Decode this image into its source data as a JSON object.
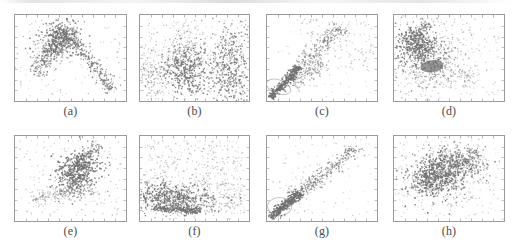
{
  "figure": {
    "width": 513,
    "height": 249,
    "background": "#ffffff",
    "rows": 2,
    "columns": 4,
    "point_color": "#6e6e6e",
    "point_color_dark": "#4a4a4a",
    "frame_color": "#9a9a9a",
    "tick_color": "#8a8a8a",
    "ellipse_color": "#b9b9b9",
    "caption_color": "#4a4a4a",
    "has_top_scan_artifact": true
  },
  "chart_data": [
    {
      "id": "a",
      "type": "scatter",
      "title": "",
      "caption": "(a)",
      "xlabel": "",
      "ylabel": "",
      "xlim": [
        0,
        1
      ],
      "ylim": [
        0,
        1
      ],
      "grid": false,
      "legend": null,
      "n_points": 1000,
      "seed": 101,
      "frame": {
        "x": 14,
        "y": 14,
        "w": 113,
        "h": 88
      },
      "caption_y": 104,
      "annotations": [],
      "clusters": [
        {
          "kind": "ridge",
          "x0": 0.18,
          "y0": 0.3,
          "x1": 0.46,
          "y1": 0.82,
          "spread": 0.045,
          "n": 230,
          "size": 1.2,
          "alpha": 0.72
        },
        {
          "kind": "ridge",
          "x0": 0.46,
          "y0": 0.82,
          "x1": 0.88,
          "y1": 0.12,
          "spread": 0.035,
          "n": 240,
          "size": 1.2,
          "alpha": 0.78
        },
        {
          "kind": "blob",
          "cx": 0.4,
          "cy": 0.72,
          "rx": 0.085,
          "ry": 0.115,
          "rot": -22,
          "n": 300,
          "size": 1.3,
          "alpha": 0.8
        },
        {
          "kind": "blob",
          "cx": 0.34,
          "cy": 0.6,
          "rx": 0.12,
          "ry": 0.08,
          "rot": 30,
          "n": 110,
          "size": 1.1,
          "alpha": 0.5
        },
        {
          "kind": "uniform",
          "x0": 0.05,
          "y0": 0.06,
          "x1": 0.95,
          "y1": 0.94,
          "n": 120,
          "size": 1.1,
          "alpha": 0.33
        }
      ]
    },
    {
      "id": "b",
      "type": "scatter",
      "title": "",
      "caption": "(b)",
      "xlabel": "",
      "ylabel": "",
      "xlim": [
        0,
        1
      ],
      "ylim": [
        0,
        1
      ],
      "grid": false,
      "legend": null,
      "n_points": 1400,
      "seed": 202,
      "frame": {
        "x": 139,
        "y": 14,
        "w": 111,
        "h": 88
      },
      "caption_y": 104,
      "annotations": [],
      "clusters": [
        {
          "kind": "blob",
          "cx": 0.44,
          "cy": 0.36,
          "rx": 0.115,
          "ry": 0.155,
          "rot": 8,
          "n": 420,
          "size": 1.25,
          "alpha": 0.78
        },
        {
          "kind": "blob",
          "cx": 0.83,
          "cy": 0.4,
          "rx": 0.095,
          "ry": 0.23,
          "rot": 0,
          "n": 400,
          "size": 1.25,
          "alpha": 0.76
        },
        {
          "kind": "blob",
          "cx": 0.1,
          "cy": 0.3,
          "rx": 0.075,
          "ry": 0.14,
          "rot": 0,
          "n": 150,
          "size": 1.1,
          "alpha": 0.5
        },
        {
          "kind": "blob",
          "cx": 0.44,
          "cy": 0.62,
          "rx": 0.07,
          "ry": 0.12,
          "rot": 0,
          "n": 110,
          "size": 1.1,
          "alpha": 0.45
        },
        {
          "kind": "uniform",
          "x0": 0.03,
          "y0": 0.05,
          "x1": 0.97,
          "y1": 0.95,
          "n": 320,
          "size": 1.1,
          "alpha": 0.34
        }
      ]
    },
    {
      "id": "c",
      "type": "scatter",
      "title": "",
      "caption": "(c)",
      "xlabel": "",
      "ylabel": "",
      "xlim": [
        0,
        1
      ],
      "ylim": [
        0,
        1
      ],
      "grid": false,
      "legend": null,
      "n_points": 900,
      "seed": 303,
      "frame": {
        "x": 266,
        "y": 14,
        "w": 112,
        "h": 88
      },
      "caption_y": 104,
      "annotations": [
        {
          "kind": "ellipse-outline",
          "cx": 0.105,
          "cy": 0.165,
          "rx": 0.115,
          "ry": 0.08,
          "rot": 20
        }
      ],
      "clusters": [
        {
          "kind": "ridge",
          "x0": 0.03,
          "y0": 0.04,
          "x1": 0.3,
          "y1": 0.4,
          "spread": 0.022,
          "n": 330,
          "size": 1.3,
          "alpha": 0.88
        },
        {
          "kind": "ridge",
          "x0": 0.28,
          "y0": 0.37,
          "x1": 0.68,
          "y1": 0.86,
          "spread": 0.045,
          "n": 200,
          "size": 1.2,
          "alpha": 0.62
        },
        {
          "kind": "ridge",
          "x0": 0.22,
          "y0": 0.18,
          "x1": 0.52,
          "y1": 0.45,
          "spread": 0.05,
          "n": 140,
          "size": 1.15,
          "alpha": 0.5
        },
        {
          "kind": "uniform",
          "x0": 0.3,
          "y0": 0.35,
          "x1": 0.97,
          "y1": 0.96,
          "n": 130,
          "size": 1.15,
          "alpha": 0.38
        },
        {
          "kind": "uniform",
          "x0": 0.05,
          "y0": 0.05,
          "x1": 0.95,
          "y1": 0.95,
          "n": 70,
          "size": 1.05,
          "alpha": 0.28
        }
      ]
    },
    {
      "id": "d",
      "type": "scatter",
      "title": "",
      "caption": "(d)",
      "xlabel": "",
      "ylabel": "",
      "xlim": [
        0,
        1
      ],
      "ylim": [
        0,
        1
      ],
      "grid": false,
      "legend": null,
      "n_points": 1300,
      "seed": 404,
      "frame": {
        "x": 393,
        "y": 14,
        "w": 112,
        "h": 88
      },
      "caption_y": 104,
      "annotations": [
        {
          "kind": "ellipse-filled",
          "cx": 0.345,
          "cy": 0.405,
          "rx": 0.105,
          "ry": 0.07,
          "rot": -8
        }
      ],
      "clusters": [
        {
          "kind": "blob",
          "cx": 0.215,
          "cy": 0.64,
          "rx": 0.09,
          "ry": 0.11,
          "rot": 15,
          "n": 380,
          "size": 1.25,
          "alpha": 0.84
        },
        {
          "kind": "blob",
          "cx": 0.34,
          "cy": 0.48,
          "rx": 0.135,
          "ry": 0.15,
          "rot": 0,
          "n": 330,
          "size": 1.2,
          "alpha": 0.64
        },
        {
          "kind": "ridge",
          "x0": 0.16,
          "y0": 0.72,
          "x1": 0.32,
          "y1": 0.9,
          "spread": 0.03,
          "n": 100,
          "size": 1.15,
          "alpha": 0.6
        },
        {
          "kind": "blob",
          "cx": 0.3,
          "cy": 0.43,
          "rx": 0.215,
          "ry": 0.25,
          "rot": 0,
          "n": 250,
          "size": 1.1,
          "alpha": 0.38
        },
        {
          "kind": "blob",
          "cx": 0.64,
          "cy": 0.3,
          "rx": 0.075,
          "ry": 0.055,
          "rot": 0,
          "n": 60,
          "size": 1.1,
          "alpha": 0.4
        },
        {
          "kind": "uniform",
          "x0": 0.04,
          "y0": 0.05,
          "x1": 0.96,
          "y1": 0.95,
          "n": 160,
          "size": 1.1,
          "alpha": 0.32
        }
      ]
    },
    {
      "id": "e",
      "type": "scatter",
      "title": "",
      "caption": "(e)",
      "xlabel": "",
      "ylabel": "",
      "xlim": [
        0,
        1
      ],
      "ylim": [
        0,
        1
      ],
      "grid": false,
      "legend": null,
      "n_points": 1000,
      "seed": 505,
      "frame": {
        "x": 14,
        "y": 135,
        "w": 113,
        "h": 87
      },
      "caption_y": 224,
      "annotations": [
        {
          "kind": "ellipse-outline",
          "cx": 0.545,
          "cy": 0.6,
          "rx": 0.12,
          "ry": 0.135,
          "rot": -25
        }
      ],
      "clusters": [
        {
          "kind": "blob",
          "cx": 0.56,
          "cy": 0.6,
          "rx": 0.095,
          "ry": 0.115,
          "rot": -28,
          "n": 400,
          "size": 1.3,
          "alpha": 0.86
        },
        {
          "kind": "ridge",
          "x0": 0.46,
          "y0": 0.56,
          "x1": 0.76,
          "y1": 0.9,
          "spread": 0.028,
          "n": 150,
          "size": 1.2,
          "alpha": 0.66
        },
        {
          "kind": "blob",
          "cx": 0.54,
          "cy": 0.375,
          "rx": 0.095,
          "ry": 0.065,
          "rot": 0,
          "n": 150,
          "size": 1.15,
          "alpha": 0.55
        },
        {
          "kind": "ridge",
          "x0": 0.15,
          "y0": 0.25,
          "x1": 0.52,
          "y1": 0.38,
          "spread": 0.045,
          "n": 130,
          "size": 1.1,
          "alpha": 0.42
        },
        {
          "kind": "uniform",
          "x0": 0.04,
          "y0": 0.05,
          "x1": 0.96,
          "y1": 0.95,
          "n": 170,
          "size": 1.1,
          "alpha": 0.33
        }
      ]
    },
    {
      "id": "f",
      "type": "scatter",
      "title": "",
      "caption": "(f)",
      "xlabel": "",
      "ylabel": "",
      "xlim": [
        0,
        1
      ],
      "ylim": [
        0,
        1
      ],
      "grid": false,
      "legend": null,
      "n_points": 1500,
      "seed": 606,
      "frame": {
        "x": 139,
        "y": 135,
        "w": 111,
        "h": 87
      },
      "caption_y": 224,
      "annotations": [],
      "clusters": [
        {
          "kind": "blob",
          "cx": 0.3,
          "cy": 0.27,
          "rx": 0.19,
          "ry": 0.08,
          "rot": -6,
          "n": 520,
          "size": 1.25,
          "alpha": 0.82
        },
        {
          "kind": "ridge",
          "x0": 0.12,
          "y0": 0.15,
          "x1": 0.56,
          "y1": 0.12,
          "spread": 0.022,
          "n": 260,
          "size": 1.2,
          "alpha": 0.8
        },
        {
          "kind": "blob",
          "cx": 0.33,
          "cy": 0.3,
          "rx": 0.27,
          "ry": 0.14,
          "rot": 0,
          "n": 260,
          "size": 1.1,
          "alpha": 0.42
        },
        {
          "kind": "uniform",
          "x0": 0.05,
          "y0": 0.4,
          "x1": 0.95,
          "y1": 0.95,
          "n": 300,
          "size": 1.1,
          "alpha": 0.36
        },
        {
          "kind": "uniform",
          "x0": 0.55,
          "y0": 0.08,
          "x1": 0.97,
          "y1": 0.45,
          "n": 160,
          "size": 1.1,
          "alpha": 0.34
        }
      ]
    },
    {
      "id": "g",
      "type": "scatter",
      "title": "",
      "caption": "(g)",
      "xlabel": "",
      "ylabel": "",
      "xlim": [
        0,
        1
      ],
      "ylim": [
        0,
        1
      ],
      "grid": false,
      "legend": null,
      "n_points": 800,
      "seed": 707,
      "frame": {
        "x": 266,
        "y": 135,
        "w": 112,
        "h": 87
      },
      "caption_y": 224,
      "annotations": [
        {
          "kind": "ellipse-outline",
          "cx": 0.115,
          "cy": 0.17,
          "rx": 0.11,
          "ry": 0.105,
          "rot": 0
        }
      ],
      "clusters": [
        {
          "kind": "ridge",
          "x0": 0.03,
          "y0": 0.04,
          "x1": 0.3,
          "y1": 0.33,
          "spread": 0.026,
          "n": 320,
          "size": 1.3,
          "alpha": 0.9
        },
        {
          "kind": "ridge",
          "x0": 0.26,
          "y0": 0.3,
          "x1": 0.84,
          "y1": 0.88,
          "spread": 0.038,
          "n": 240,
          "size": 1.2,
          "alpha": 0.64
        },
        {
          "kind": "ridge",
          "x0": 0.18,
          "y0": 0.22,
          "x1": 0.46,
          "y1": 0.5,
          "spread": 0.045,
          "n": 110,
          "size": 1.15,
          "alpha": 0.48
        },
        {
          "kind": "uniform",
          "x0": 0.05,
          "y0": 0.05,
          "x1": 0.97,
          "y1": 0.96,
          "n": 90,
          "size": 1.1,
          "alpha": 0.3
        }
      ]
    },
    {
      "id": "h",
      "type": "scatter",
      "title": "",
      "caption": "(h)",
      "xlabel": "",
      "ylabel": "",
      "xlim": [
        0,
        1
      ],
      "ylim": [
        0,
        1
      ],
      "grid": false,
      "legend": null,
      "n_points": 1400,
      "seed": 808,
      "frame": {
        "x": 393,
        "y": 135,
        "w": 112,
        "h": 87
      },
      "caption_y": 224,
      "annotations": [
        {
          "kind": "ellipse-outline",
          "cx": 0.345,
          "cy": 0.51,
          "rx": 0.135,
          "ry": 0.15,
          "rot": 0
        }
      ],
      "clusters": [
        {
          "kind": "blob",
          "cx": 0.35,
          "cy": 0.5,
          "rx": 0.11,
          "ry": 0.125,
          "rot": 0,
          "n": 400,
          "size": 1.3,
          "alpha": 0.84
        },
        {
          "kind": "blob",
          "cx": 0.56,
          "cy": 0.66,
          "rx": 0.13,
          "ry": 0.115,
          "rot": 20,
          "n": 360,
          "size": 1.25,
          "alpha": 0.78
        },
        {
          "kind": "ridge",
          "x0": 0.3,
          "y0": 0.42,
          "x1": 0.78,
          "y1": 0.8,
          "spread": 0.075,
          "n": 260,
          "size": 1.15,
          "alpha": 0.52
        },
        {
          "kind": "blob",
          "cx": 0.43,
          "cy": 0.54,
          "rx": 0.25,
          "ry": 0.23,
          "rot": 0,
          "n": 220,
          "size": 1.1,
          "alpha": 0.36
        },
        {
          "kind": "uniform",
          "x0": 0.04,
          "y0": 0.05,
          "x1": 0.96,
          "y1": 0.95,
          "n": 160,
          "size": 1.1,
          "alpha": 0.32
        }
      ]
    }
  ]
}
